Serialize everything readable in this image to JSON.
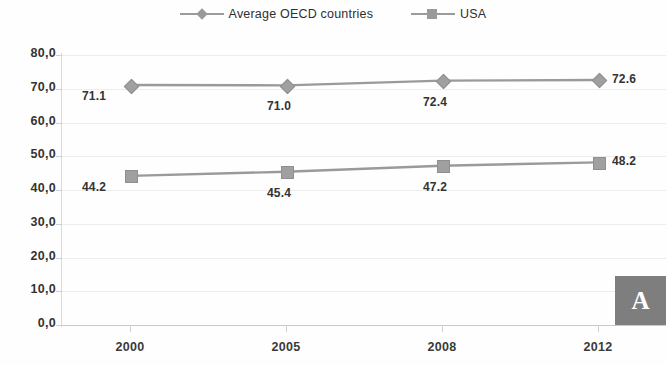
{
  "chart_data": {
    "type": "line",
    "title": "",
    "subtitle": "",
    "xlabel": "",
    "ylabel": "",
    "categories": [
      "2000",
      "2005",
      "2008",
      "2012"
    ],
    "series": [
      {
        "name": "Average OECD countries",
        "marker": "diamond",
        "color": "#9a9a9a",
        "values": [
          71.1,
          71.0,
          72.4,
          72.6
        ],
        "labels": [
          "71.1",
          "71.0",
          "72.4",
          "72.6"
        ]
      },
      {
        "name": "USA",
        "marker": "square",
        "color": "#9a9a9a",
        "values": [
          44.2,
          45.4,
          47.2,
          48.2
        ],
        "labels": [
          "44.2",
          "45.4",
          "47.2",
          "48.2"
        ]
      }
    ],
    "ylim": [
      0,
      80
    ],
    "ytick_values": [
      0,
      10,
      20,
      30,
      40,
      50,
      60,
      70,
      80
    ],
    "ytick_labels": [
      "0,0",
      "10,0",
      "20,0",
      "30,0",
      "40,0",
      "50,0",
      "60,0",
      "70,0",
      "80,0"
    ],
    "grid": true,
    "legend_position": "top-center"
  },
  "legend": {
    "entries": [
      {
        "label": "Average OECD countries",
        "marker": "diamond-marker"
      },
      {
        "label": "USA",
        "marker": "square-marker"
      }
    ]
  },
  "panel": {
    "tag": "A"
  }
}
